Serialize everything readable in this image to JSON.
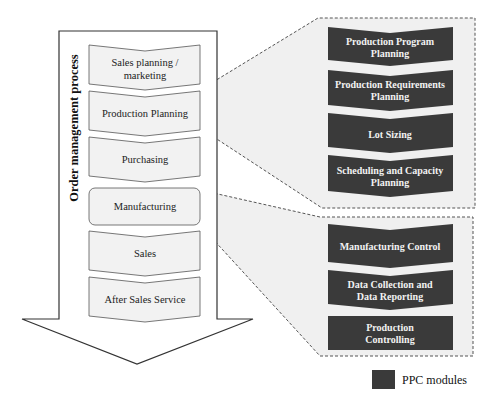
{
  "process": {
    "title": "Order management process",
    "steps": [
      {
        "line1": "Sales planning /",
        "line2": "marketing"
      },
      {
        "line1": "Production  Planning",
        "line2": ""
      },
      {
        "line1": "Purchasing",
        "line2": ""
      },
      {
        "line1": "Manufacturing",
        "line2": ""
      },
      {
        "line1": "Sales",
        "line2": ""
      },
      {
        "line1": "After  Sales  Service",
        "line2": ""
      }
    ]
  },
  "planning_modules": [
    {
      "line1": "Production Program",
      "line2": "Planning"
    },
    {
      "line1": "Production Requirements",
      "line2": "Planning"
    },
    {
      "line1": "Lot Sizing",
      "line2": ""
    },
    {
      "line1": "Scheduling and Capacity",
      "line2": "Planning"
    }
  ],
  "manufacturing_modules": [
    {
      "line1": "Manufacturing Control",
      "line2": ""
    },
    {
      "line1": "Data Collection and",
      "line2": "Data Reporting"
    },
    {
      "line1": "Production",
      "line2": "Controlling"
    }
  ],
  "legend": {
    "label": "PPC modules",
    "color": "#3a3a3a"
  },
  "colors": {
    "module_fill": "#3a3a3a",
    "step_fill": "#f2f2f2",
    "callout_fill": "#efefef",
    "stroke": "#333333"
  }
}
